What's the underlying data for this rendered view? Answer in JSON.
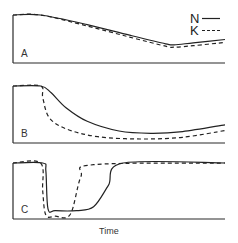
{
  "chart_data": {
    "type": "line",
    "xlabel": "Time",
    "ylabel": "",
    "legend": {
      "placement": "top-right",
      "entries": [
        {
          "label": "N",
          "style": "solid"
        },
        {
          "label": "K",
          "style": "dashed"
        }
      ]
    },
    "x_range": [
      0,
      1
    ],
    "y_range": [
      0,
      1
    ],
    "grid": false,
    "panels": [
      {
        "label": "A",
        "series": [
          {
            "name": "N",
            "x": [
              0,
              0.13,
              0.35,
              0.55,
              0.72,
              0.76,
              0.85,
              1.0
            ],
            "y": [
              1.0,
              1.0,
              0.8,
              0.58,
              0.4,
              0.38,
              0.42,
              0.49
            ]
          },
          {
            "name": "K",
            "x": [
              0,
              0.13,
              0.35,
              0.55,
              0.72,
              0.76,
              0.85,
              1.0
            ],
            "y": [
              1.0,
              1.0,
              0.77,
              0.54,
              0.35,
              0.33,
              0.36,
              0.43
            ]
          }
        ]
      },
      {
        "label": "B",
        "series": [
          {
            "name": "N",
            "x": [
              0,
              0.13,
              0.18,
              0.25,
              0.35,
              0.5,
              0.65,
              0.8,
              1.0
            ],
            "y": [
              1.0,
              1.0,
              0.88,
              0.62,
              0.38,
              0.21,
              0.17,
              0.2,
              0.32
            ]
          },
          {
            "name": "K",
            "x": [
              0,
              0.13,
              0.14,
              0.17,
              0.25,
              0.4,
              0.6,
              0.8,
              1.0
            ],
            "y": [
              1.0,
              1.0,
              0.8,
              0.45,
              0.25,
              0.11,
              0.07,
              0.1,
              0.22
            ]
          }
        ]
      },
      {
        "label": "C",
        "series": [
          {
            "name": "N",
            "x": [
              0,
              0.14,
              0.155,
              0.165,
              0.2,
              0.3,
              0.38,
              0.45,
              0.52,
              1.0
            ],
            "y": [
              1.0,
              1.0,
              0.85,
              0.18,
              0.15,
              0.15,
              0.22,
              0.6,
              1.0,
              1.0
            ]
          },
          {
            "name": "K",
            "x": [
              0,
              0.13,
              0.14,
              0.155,
              0.2,
              0.27,
              0.32,
              0.38,
              1.0
            ],
            "y": [
              1.0,
              1.0,
              0.5,
              0.07,
              0.05,
              0.08,
              0.75,
              0.97,
              1.0
            ]
          }
        ]
      }
    ]
  }
}
